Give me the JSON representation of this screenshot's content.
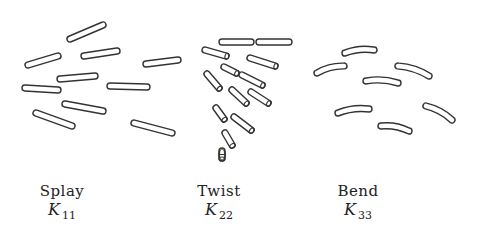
{
  "panels": [
    {
      "id": "splay",
      "name": "Splay",
      "symbol": "K",
      "subscript": "11",
      "label_x": 60,
      "rods": [
        {
          "x1": 70,
          "y1": 39,
          "x2": 103,
          "y2": 25
        },
        {
          "x1": 28,
          "y1": 65,
          "x2": 58,
          "y2": 56
        },
        {
          "x1": 84,
          "y1": 56,
          "x2": 117,
          "y2": 51
        },
        {
          "x1": 146,
          "y1": 64,
          "x2": 178,
          "y2": 60
        },
        {
          "x1": 60,
          "y1": 79,
          "x2": 95,
          "y2": 76
        },
        {
          "x1": 25,
          "y1": 88,
          "x2": 58,
          "y2": 90
        },
        {
          "x1": 110,
          "y1": 86,
          "x2": 147,
          "y2": 87
        },
        {
          "x1": 65,
          "y1": 104,
          "x2": 103,
          "y2": 111
        },
        {
          "x1": 36,
          "y1": 113,
          "x2": 72,
          "y2": 126
        },
        {
          "x1": 134,
          "y1": 123,
          "x2": 172,
          "y2": 133
        }
      ]
    },
    {
      "id": "twist",
      "name": "Twist",
      "symbol": "K",
      "subscript": "22",
      "label_x": 195,
      "rods": [
        {
          "x1": 222,
          "y1": 42,
          "x2": 251,
          "y2": 42,
          "flat": true
        },
        {
          "x1": 259,
          "y1": 42,
          "x2": 289,
          "y2": 42,
          "flat": true
        },
        {
          "x1": 205,
          "y1": 50,
          "x2": 226,
          "y2": 56
        },
        {
          "x1": 250,
          "y1": 58,
          "x2": 275,
          "y2": 66
        },
        {
          "x1": 224,
          "y1": 67,
          "x2": 236,
          "y2": 73
        },
        {
          "x1": 242,
          "y1": 75,
          "x2": 262,
          "y2": 85
        },
        {
          "x1": 207,
          "y1": 74,
          "x2": 219,
          "y2": 88
        },
        {
          "x1": 232,
          "y1": 90,
          "x2": 246,
          "y2": 103
        },
        {
          "x1": 251,
          "y1": 92,
          "x2": 268,
          "y2": 103
        },
        {
          "x1": 216,
          "y1": 108,
          "x2": 224,
          "y2": 119
        },
        {
          "x1": 234,
          "y1": 117,
          "x2": 251,
          "y2": 130
        },
        {
          "x1": 225,
          "y1": 133,
          "x2": 232,
          "y2": 145
        },
        {
          "x1": 222,
          "y1": 151,
          "x2": 222,
          "y2": 158
        }
      ]
    },
    {
      "id": "bend",
      "name": "Bend",
      "symbol": "K",
      "subscript": "33",
      "label_x": 312,
      "rods": [
        {
          "x1": 345,
          "y1": 53,
          "x2": 374,
          "y2": 50,
          "curve": 2
        },
        {
          "x1": 317,
          "y1": 73,
          "x2": 344,
          "y2": 66,
          "curve": 2
        },
        {
          "x1": 398,
          "y1": 66,
          "x2": 429,
          "y2": 76,
          "curve": 2
        },
        {
          "x1": 366,
          "y1": 81,
          "x2": 398,
          "y2": 83,
          "curve": 2
        },
        {
          "x1": 338,
          "y1": 113,
          "x2": 369,
          "y2": 109,
          "curve": 2
        },
        {
          "x1": 426,
          "y1": 106,
          "x2": 452,
          "y2": 120,
          "curve": 2
        },
        {
          "x1": 381,
          "y1": 126,
          "x2": 409,
          "y2": 131,
          "curve": 2
        }
      ]
    }
  ],
  "theta_label": "θ",
  "colors": {
    "stroke": "#333333",
    "text": "#222222",
    "background": "#ffffff"
  }
}
